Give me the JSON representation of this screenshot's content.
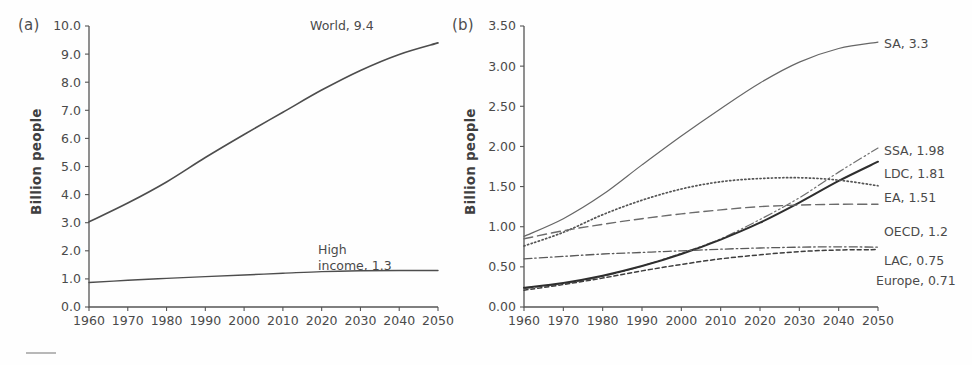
{
  "figure": {
    "panel_a_tag": "(a)",
    "panel_b_tag": "(b)",
    "y_axis_title": "Billion people"
  },
  "chart_data": [
    {
      "type": "line",
      "panel": "(a)",
      "title": "",
      "xlabel": "",
      "ylabel": "Billion people",
      "xlim": [
        1960,
        2050
      ],
      "ylim": [
        0.0,
        10.0
      ],
      "grid": false,
      "legend": "inline-end-labels",
      "xticks": [
        1960,
        1970,
        1980,
        1990,
        2000,
        2010,
        2020,
        2030,
        2040,
        2050
      ],
      "xtick_labels": [
        "1960",
        "1970",
        "1980",
        "1990",
        "2000",
        "2010",
        "2020",
        "2030",
        "2040",
        "2050"
      ],
      "yticks": [
        0.0,
        1.0,
        2.0,
        3.0,
        4.0,
        5.0,
        6.0,
        7.0,
        8.0,
        9.0,
        10.0
      ],
      "ytick_labels": [
        "0.0",
        "1.0",
        "2.0",
        "3.0",
        "4.0",
        "5.0",
        "6.0",
        "7.0",
        "8.0",
        "9.0",
        "10.0"
      ],
      "x": [
        1960,
        1970,
        1980,
        1990,
        2000,
        2010,
        2020,
        2030,
        2040,
        2050
      ],
      "series": [
        {
          "name": "World",
          "end_value": 9.4,
          "label": "World, 9.4",
          "style": "solid",
          "color": "#4d4d4d",
          "width": 1.6,
          "values": [
            3.03,
            3.7,
            4.45,
            5.32,
            6.14,
            6.93,
            7.72,
            8.42,
            8.99,
            9.4
          ]
        },
        {
          "name": "High income",
          "end_value": 1.3,
          "label": "High income, 1.3",
          "style": "solid",
          "color": "#4d4d4d",
          "width": 1.4,
          "values": [
            0.87,
            0.95,
            1.02,
            1.08,
            1.14,
            1.2,
            1.26,
            1.29,
            1.3,
            1.3
          ]
        }
      ]
    },
    {
      "type": "line",
      "panel": "(b)",
      "title": "",
      "xlabel": "",
      "ylabel": "Billion people",
      "xlim": [
        1960,
        2050
      ],
      "ylim": [
        0.0,
        3.5
      ],
      "grid": false,
      "legend": "inline-end-labels",
      "xticks": [
        1960,
        1970,
        1980,
        1990,
        2000,
        2010,
        2020,
        2030,
        2040,
        2050
      ],
      "xtick_labels": [
        "1960",
        "1970",
        "1980",
        "1990",
        "2000",
        "2010",
        "2020",
        "2030",
        "2040",
        "2050"
      ],
      "yticks": [
        0.0,
        0.5,
        1.0,
        1.5,
        2.0,
        2.5,
        3.0,
        3.5
      ],
      "ytick_labels": [
        "0.00",
        "0.50",
        "1.00",
        "1.50",
        "2.00",
        "2.50",
        "3.00",
        "3.50"
      ],
      "x": [
        1960,
        1970,
        1980,
        1990,
        2000,
        2010,
        2020,
        2030,
        2040,
        2050
      ],
      "series": [
        {
          "name": "SA",
          "end_value": 3.3,
          "label": "SA, 3.3",
          "style": "solid-thin",
          "color": "#666666",
          "width": 1.2,
          "values": [
            0.88,
            1.1,
            1.4,
            1.77,
            2.13,
            2.47,
            2.79,
            3.05,
            3.22,
            3.3
          ]
        },
        {
          "name": "SSA",
          "end_value": 1.98,
          "label": "SSA, 1.98",
          "style": "dash-dot-dot",
          "color": "#707070",
          "width": 1.2,
          "values": [
            0.23,
            0.29,
            0.38,
            0.51,
            0.67,
            0.85,
            1.09,
            1.36,
            1.68,
            1.98
          ]
        },
        {
          "name": "LDC",
          "end_value": 1.81,
          "label": "LDC, 1.81",
          "style": "solid-thick",
          "color": "#2e2e2e",
          "width": 2.0,
          "values": [
            0.24,
            0.3,
            0.39,
            0.51,
            0.66,
            0.84,
            1.05,
            1.3,
            1.57,
            1.81
          ]
        },
        {
          "name": "EA",
          "end_value": 1.51,
          "label": "EA, 1.51",
          "style": "dotted",
          "color": "#555555",
          "width": 1.7,
          "values": [
            0.76,
            0.93,
            1.15,
            1.33,
            1.47,
            1.56,
            1.6,
            1.61,
            1.58,
            1.51
          ]
        },
        {
          "name": "OECD",
          "end_value": 1.2,
          "label": "OECD, 1.2",
          "style": "long-dash",
          "color": "#6b6b6b",
          "width": 1.4,
          "values": [
            0.85,
            0.95,
            1.03,
            1.1,
            1.16,
            1.21,
            1.25,
            1.27,
            1.28,
            1.28
          ]
        },
        {
          "name": "LAC",
          "end_value": 0.75,
          "label": "LAC, 0.75",
          "style": "dash-dot",
          "color": "#5a5a5a",
          "width": 1.3,
          "values": [
            0.6,
            0.63,
            0.66,
            0.68,
            0.7,
            0.72,
            0.735,
            0.745,
            0.75,
            0.745
          ]
        },
        {
          "name": "Europe",
          "end_value": 0.71,
          "label": "Europe, 0.71",
          "style": "short-dash",
          "color": "#3d3d3d",
          "width": 1.5,
          "values": [
            0.21,
            0.28,
            0.36,
            0.45,
            0.53,
            0.6,
            0.65,
            0.69,
            0.71,
            0.715
          ]
        }
      ]
    }
  ]
}
